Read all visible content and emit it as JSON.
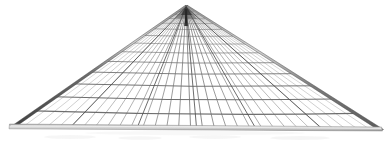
{
  "image": {
    "title": "Perspective wireframe grid structure",
    "subject": "triangular gridshell roof in one-point perspective",
    "background_color": "#ffffff",
    "width": 388,
    "height": 143
  },
  "palette": {
    "background": "#ffffff",
    "grid_line": "#6e6e6e",
    "grid_line_light": "#9a9a9a",
    "grid_line_far": "#4a4a4a",
    "edge_beam_dark": "#4f4f4f",
    "edge_beam_mid": "#7d7d7d",
    "edge_beam_highlight": "#d8d8d8",
    "bottom_rail_fill": "#cfcfcf",
    "bottom_rail_edge": "#8a8a8a",
    "apex_shadow": "#2e2e2e",
    "faint_floor_smudge": "#efefef"
  },
  "geometry": {
    "apex": {
      "x": 186,
      "y": 7,
      "label": "vanishing-point-apex"
    },
    "bottom_left": {
      "x": 12,
      "y": 126,
      "label": "left-base-corner"
    },
    "bottom_right": {
      "x": 381,
      "y": 129,
      "label": "right-base-corner"
    },
    "base_line_y_left": 126,
    "base_line_y_right": 129,
    "radial_line_count": 31,
    "horizontal_band_count": 17,
    "edge_beam_width_px": 4,
    "bottom_rail_height_px": 5,
    "perspective_exponent": 2.25,
    "sag_curvature_px": 5
  },
  "elements": {
    "apex_label": "apex",
    "left_beam_label": "left edge beam",
    "right_beam_label": "right edge beam",
    "bottom_rail_label": "bottom rail",
    "grid_label": "perspective grid mesh"
  },
  "chart_data": {
    "type": "line",
    "xlabel": "",
    "ylabel": "",
    "radial_lines": 31,
    "transverse_lines": 17,
    "vanishing_point": [
      186,
      7
    ],
    "base_endpoints": [
      [
        12,
        126
      ],
      [
        381,
        129
      ]
    ]
  }
}
